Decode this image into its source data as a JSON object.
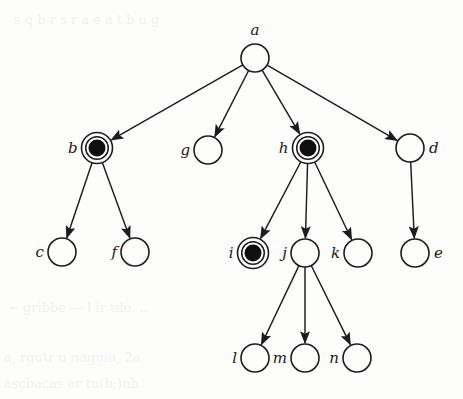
{
  "diagram": {
    "type": "rooted-tree",
    "width": 463,
    "height": 399,
    "background_color": "#fdfdfc",
    "stroke_color": "#1d1b1e",
    "marked_fill_color": "#100f11",
    "node_radius": 14,
    "marked_ring_radius": 15.5,
    "marked_core_radius": 8.5,
    "nodes": [
      {
        "id": "a",
        "label": "a",
        "x": 255,
        "y": 58,
        "marked": false,
        "label_pos": "top"
      },
      {
        "id": "b",
        "label": "b",
        "x": 97,
        "y": 148,
        "marked": true,
        "label_pos": "left"
      },
      {
        "id": "g",
        "label": "g",
        "x": 208,
        "y": 150,
        "marked": false,
        "label_pos": "left"
      },
      {
        "id": "h",
        "label": "h",
        "x": 308,
        "y": 148,
        "marked": true,
        "label_pos": "left"
      },
      {
        "id": "d",
        "label": "d",
        "x": 410,
        "y": 148,
        "marked": false,
        "label_pos": "right"
      },
      {
        "id": "c",
        "label": "c",
        "x": 62,
        "y": 252,
        "marked": false,
        "label_pos": "left"
      },
      {
        "id": "f",
        "label": "f",
        "x": 135,
        "y": 252,
        "marked": false,
        "label_pos": "left"
      },
      {
        "id": "i",
        "label": "i",
        "x": 253,
        "y": 253,
        "marked": true,
        "label_pos": "left"
      },
      {
        "id": "j",
        "label": "j",
        "x": 305,
        "y": 253,
        "marked": false,
        "label_pos": "left"
      },
      {
        "id": "k",
        "label": "k",
        "x": 358,
        "y": 253,
        "marked": false,
        "label_pos": "left"
      },
      {
        "id": "e",
        "label": "e",
        "x": 415,
        "y": 253,
        "marked": false,
        "label_pos": "right"
      },
      {
        "id": "l",
        "label": "l",
        "x": 255,
        "y": 358,
        "marked": false,
        "label_pos": "left"
      },
      {
        "id": "m",
        "label": "m",
        "x": 305,
        "y": 358,
        "marked": false,
        "label_pos": "left"
      },
      {
        "id": "n",
        "label": "n",
        "x": 357,
        "y": 358,
        "marked": false,
        "label_pos": "left"
      }
    ],
    "edges": [
      {
        "from": "a",
        "to": "b"
      },
      {
        "from": "a",
        "to": "g"
      },
      {
        "from": "a",
        "to": "h"
      },
      {
        "from": "a",
        "to": "d"
      },
      {
        "from": "b",
        "to": "c"
      },
      {
        "from": "b",
        "to": "f"
      },
      {
        "from": "h",
        "to": "i"
      },
      {
        "from": "h",
        "to": "j"
      },
      {
        "from": "h",
        "to": "k"
      },
      {
        "from": "d",
        "to": "e"
      },
      {
        "from": "j",
        "to": "l"
      },
      {
        "from": "j",
        "to": "m"
      },
      {
        "from": "j",
        "to": "n"
      }
    ],
    "marked_nodes": [
      "b",
      "h",
      "i"
    ]
  }
}
